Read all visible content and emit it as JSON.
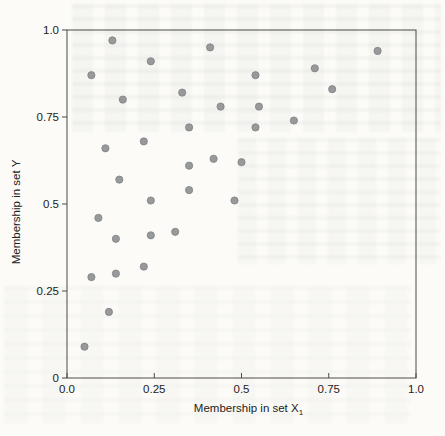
{
  "page": {
    "kind": "scanned textbook scatter-plot figure",
    "background_color": "#fcfbf8"
  },
  "chart_data": {
    "type": "scatter",
    "title": "",
    "xlabel": "Membership in set X",
    "xlabel_subscript": "1",
    "ylabel": "Membership in set Y",
    "xlim": [
      0.0,
      1.0
    ],
    "ylim": [
      0.0,
      1.0
    ],
    "grid": false,
    "legend": null,
    "frame": "full box",
    "axis_color": "#4a4a48",
    "text_color": "#222220",
    "marker_color": "#98999b",
    "marker_edge_color": "#7e8082",
    "x_ticks": {
      "values": [
        0.0,
        0.25,
        0.5,
        0.75,
        1.0
      ],
      "labels": [
        "0.0",
        "0.25",
        "0.5",
        "0.75",
        "1.0"
      ]
    },
    "y_ticks": {
      "values": [
        0.0,
        0.25,
        0.5,
        0.75,
        1.0
      ],
      "labels": [
        "0",
        "0.25",
        "0.5",
        "0.75",
        "1.0"
      ]
    },
    "points": [
      [
        0.13,
        0.97
      ],
      [
        0.41,
        0.95
      ],
      [
        0.89,
        0.94
      ],
      [
        0.24,
        0.91
      ],
      [
        0.71,
        0.89
      ],
      [
        0.54,
        0.87
      ],
      [
        0.07,
        0.87
      ],
      [
        0.76,
        0.83
      ],
      [
        0.33,
        0.82
      ],
      [
        0.16,
        0.8
      ],
      [
        0.44,
        0.78
      ],
      [
        0.55,
        0.78
      ],
      [
        0.65,
        0.74
      ],
      [
        0.35,
        0.72
      ],
      [
        0.54,
        0.72
      ],
      [
        0.22,
        0.68
      ],
      [
        0.11,
        0.66
      ],
      [
        0.42,
        0.63
      ],
      [
        0.5,
        0.62
      ],
      [
        0.35,
        0.61
      ],
      [
        0.15,
        0.57
      ],
      [
        0.35,
        0.54
      ],
      [
        0.24,
        0.51
      ],
      [
        0.48,
        0.51
      ],
      [
        0.09,
        0.46
      ],
      [
        0.31,
        0.42
      ],
      [
        0.24,
        0.41
      ],
      [
        0.14,
        0.4
      ],
      [
        0.22,
        0.32
      ],
      [
        0.14,
        0.3
      ],
      [
        0.07,
        0.29
      ],
      [
        0.12,
        0.19
      ],
      [
        0.05,
        0.09
      ]
    ]
  }
}
